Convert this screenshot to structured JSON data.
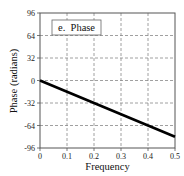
{
  "chart_data": {
    "type": "line",
    "title": "",
    "legend": {
      "label": "e.  Phase",
      "position": "top-left"
    },
    "xlabel": "Frequency",
    "ylabel": "Phase (radians)",
    "xlim": [
      0,
      0.5
    ],
    "ylim": [
      -96,
      96
    ],
    "xticks": [
      0,
      0.1,
      0.2,
      0.3,
      0.4,
      0.5
    ],
    "xtick_labels": [
      "0",
      "0.1",
      "0.2",
      "0.3",
      "0.4",
      "0.5"
    ],
    "yticks": [
      96,
      64,
      32,
      0,
      -32,
      -64,
      -96
    ],
    "ytick_labels": [
      "96",
      "64",
      "32",
      "0",
      "-32",
      "-64",
      "-96"
    ],
    "grid": true,
    "grid_style": "dashed",
    "series": [
      {
        "name": "Phase",
        "x": [
          0,
          0.1,
          0.2,
          0.3,
          0.4,
          0.5
        ],
        "values": [
          0,
          -16,
          -32,
          -48,
          -64,
          -80
        ],
        "color": "#000000"
      }
    ]
  },
  "colors": {
    "line": "#000000",
    "grid": "#888888",
    "frame": "#555555"
  }
}
